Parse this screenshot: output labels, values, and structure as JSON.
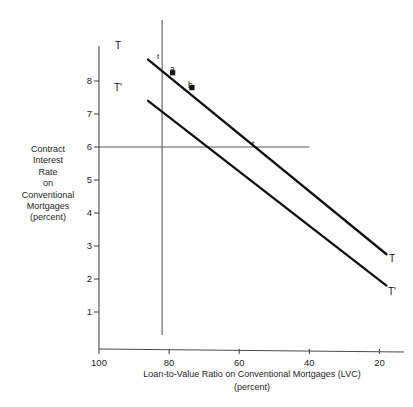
{
  "chart_data": {
    "type": "line",
    "title": "",
    "xlabel": "Loan-to-Value Ratio on Conventional Mortgages (LVC)",
    "xlabel_units": "(percent)",
    "ylabel_lines": [
      "Contract",
      "Interest",
      "Rate",
      "on",
      "Conventional",
      "Mortgages",
      "(percent)"
    ],
    "xlim": [
      100,
      13
    ],
    "ylim": [
      0.3,
      8.8
    ],
    "x_inverted": true,
    "grid": false,
    "legend": "none",
    "xticks": [
      100,
      80,
      60,
      40,
      20
    ],
    "yticks": [
      1,
      2,
      3,
      4,
      5,
      6,
      7,
      8
    ],
    "series": [
      {
        "name": "T",
        "label_left": "T",
        "label_right": "T",
        "x": [
          86,
          18
        ],
        "y": [
          8.65,
          2.75
        ]
      },
      {
        "name": "T'",
        "label_left": "T'",
        "label_right": "T'",
        "x": [
          86,
          18
        ],
        "y": [
          7.4,
          1.8
        ]
      }
    ],
    "reference_lines": [
      {
        "name": "vertical-lvc-line",
        "orientation": "vertical",
        "x": 82,
        "y_from": 0.3,
        "y_to": 8.8
      },
      {
        "name": "horizontal-rate-line",
        "orientation": "horizontal",
        "y": 6,
        "x_from": 100,
        "x_to": 40,
        "label": "t"
      }
    ],
    "points": [
      {
        "name": "a",
        "label": "a",
        "x": 79,
        "y": 8.25
      },
      {
        "name": "b",
        "label": "b",
        "x": 73.5,
        "y": 7.8
      }
    ],
    "annotations": [
      {
        "name": "t-upper",
        "label": "t",
        "x": 81.5,
        "y": 8.72
      },
      {
        "name": "t-on-rate-line",
        "label": "t",
        "x": 52.5,
        "y": 6.2
      }
    ]
  },
  "caption": {
    "partial_text": ""
  }
}
